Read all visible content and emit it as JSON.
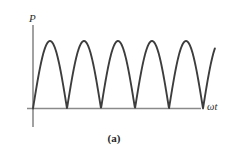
{
  "figure": {
    "caption": "(a)",
    "y_axis_label": "P",
    "x_axis_label": "ωt",
    "background_color": "#ffffff",
    "curve_color": "#3d3d3d",
    "axis_color": "#8a8a8a"
  },
  "chart_data": {
    "type": "line",
    "title": "",
    "subtitle": "",
    "xlabel": "ωt",
    "ylabel": "P",
    "grid": false,
    "legend": null,
    "annotations": [
      "(a)"
    ],
    "waveform": "abs_sine",
    "xlim": [
      0,
      5.6
    ],
    "ylim": [
      0,
      1.12
    ],
    "x_unit": "pi radians",
    "period_in_pi": 1,
    "amplitude": 1,
    "n_humps": 5,
    "peak_x": [
      0.5,
      1.5,
      2.5,
      3.5,
      4.5
    ],
    "peak_y": [
      1,
      1,
      1,
      1,
      1
    ],
    "zero_crossings_x": [
      0,
      1,
      2,
      3,
      4,
      5
    ],
    "curve_end_x": 5.35,
    "curve_end_y": 0.45,
    "x": [
      0,
      0.1,
      0.2,
      0.3,
      0.4,
      0.5,
      0.6,
      0.7,
      0.8,
      0.9,
      1.0,
      1.1,
      1.2,
      1.3,
      1.4,
      1.5,
      1.6,
      1.7,
      1.8,
      1.9,
      2.0,
      2.1,
      2.2,
      2.3,
      2.4,
      2.5,
      2.6,
      2.7,
      2.8,
      2.9,
      3.0,
      3.1,
      3.2,
      3.3,
      3.4,
      3.5,
      3.6,
      3.7,
      3.8,
      3.9,
      4.0,
      4.1,
      4.2,
      4.3,
      4.4,
      4.5,
      4.6,
      4.7,
      4.8,
      4.9,
      5.0,
      5.1,
      5.2,
      5.3,
      5.35
    ],
    "y": [
      0,
      0.309,
      0.588,
      0.809,
      0.951,
      1.0,
      0.951,
      0.809,
      0.588,
      0.309,
      0,
      0.309,
      0.588,
      0.809,
      0.951,
      1.0,
      0.951,
      0.809,
      0.588,
      0.309,
      0,
      0.309,
      0.588,
      0.809,
      0.951,
      1.0,
      0.951,
      0.809,
      0.588,
      0.309,
      0,
      0.309,
      0.588,
      0.809,
      0.951,
      1.0,
      0.951,
      0.809,
      0.588,
      0.309,
      0,
      0.309,
      0.588,
      0.809,
      0.951,
      1.0,
      0.951,
      0.809,
      0.588,
      0.309,
      0,
      0.309,
      0.588,
      0.809,
      0.891
    ]
  },
  "geometry": {
    "y_axis_x": 33,
    "y_axis_top": 25,
    "y_axis_bottom": 127,
    "x_axis_y": 108.5,
    "x_axis_left": 27,
    "x_axis_right": 201,
    "baseline_y": 108.5,
    "peak_y_px": 41,
    "hump_width_px": 34,
    "first_zero_x_px": 33,
    "curve_end_x_px": 196,
    "curve_end_y_px": 79
  }
}
